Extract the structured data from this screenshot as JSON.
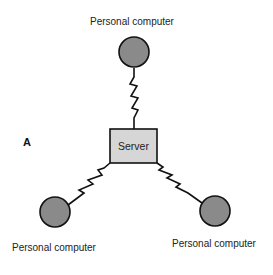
{
  "panel_label": "A",
  "nodes": {
    "top": {
      "label": "Personal computer"
    },
    "left": {
      "label": "Personal computer"
    },
    "right": {
      "label": "Personal computer"
    },
    "server": {
      "label": "Server"
    }
  },
  "colors": {
    "pc_fill": "#8a8a8a",
    "server_fill": "#d6d6d6",
    "stroke": "#111111"
  }
}
